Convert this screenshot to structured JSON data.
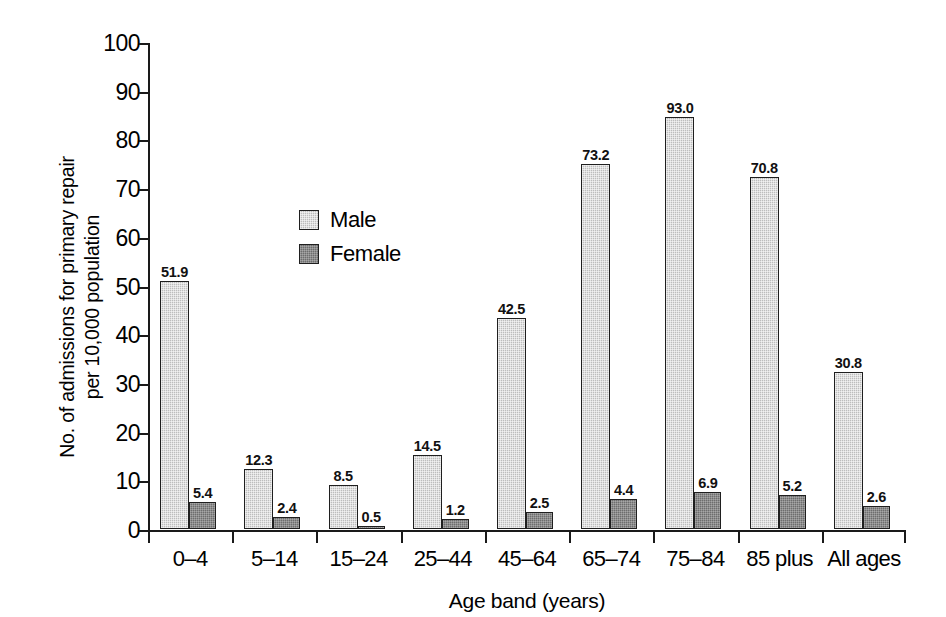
{
  "chart_data": {
    "type": "bar",
    "title": "",
    "xlabel": "Age band (years)",
    "ylabel": "No. of admissions for primary repair per 10,000 population",
    "ylabel_line1": "No. of admissions for primary repair",
    "ylabel_line2": "per 10,000 population",
    "ylim": [
      0,
      100
    ],
    "yticks": [
      0,
      10,
      20,
      30,
      40,
      50,
      60,
      70,
      80,
      90,
      100
    ],
    "ytick_labels": [
      "0",
      "10",
      "20",
      "30",
      "40",
      "50",
      "60",
      "70",
      "80",
      "90",
      "100"
    ],
    "grid": false,
    "legend_position": "upper-left-inside",
    "categories": [
      "0–4",
      "5–14",
      "15–24",
      "25–44",
      "45–64",
      "65–74",
      "75–84",
      "85 plus",
      "All ages"
    ],
    "series": [
      {
        "name": "Male",
        "color": "#bdbdbd",
        "values": [
          51.9,
          12.3,
          8.5,
          14.5,
          42.5,
          73.2,
          93.0,
          70.8,
          30.8
        ],
        "labels": [
          "51.9",
          "12.3",
          "8.5",
          "14.5",
          "42.5",
          "73.2",
          "93.0",
          "70.8",
          "30.8"
        ],
        "drawn_heights": [
          51.0,
          12.4,
          9.0,
          15.2,
          43.4,
          75.0,
          84.7,
          72.2,
          32.2
        ]
      },
      {
        "name": "Female",
        "color": "#6d6d6d",
        "values": [
          5.4,
          2.4,
          0.5,
          1.2,
          2.5,
          4.4,
          6.9,
          5.2,
          2.6
        ],
        "labels": [
          "5.4",
          "2.4",
          "0.5",
          "1.2",
          "2.5",
          "4.4",
          "6.9",
          "5.2",
          "2.6"
        ],
        "drawn_heights": [
          5.5,
          2.5,
          0.6,
          2.0,
          3.4,
          6.2,
          7.7,
          7.0,
          4.8
        ]
      }
    ]
  },
  "legend": {
    "items": [
      {
        "label": "Male",
        "color": "#bdbdbd"
      },
      {
        "label": "Female",
        "color": "#6d6d6d"
      }
    ]
  },
  "axes": {
    "y_title_line1": "No. of admissions for primary repair",
    "y_title_line2": "per 10,000 population",
    "x_title": "Age band (years)"
  },
  "colors": {
    "male": "#bdbdbd",
    "female": "#6d6d6d",
    "axis": "#1a1a1a",
    "background": "#ffffff",
    "text": "#000000"
  }
}
